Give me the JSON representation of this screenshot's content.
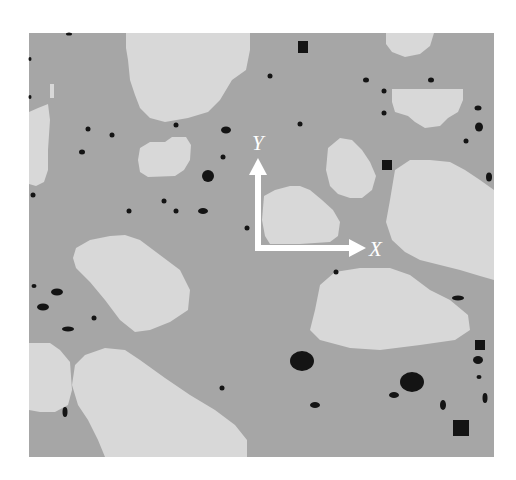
{
  "figure": {
    "frame": {
      "x": 29,
      "y": 33,
      "width": 465,
      "height": 424
    },
    "colors": {
      "background": "#ffffff",
      "matrix": "#a6a6a6",
      "grain": "#d8d8d8",
      "particle": "#141414",
      "axes": "#ffffff"
    },
    "axes": {
      "origin": {
        "x": 258,
        "y": 248
      },
      "x_label": "X",
      "y_label": "Y"
    },
    "grains": [
      {
        "id": "grain-top-center",
        "points": "126,33 250,33 250,50 246,70 232,80 220,100 208,112 188,118 165,122 150,118 140,108 135,95 130,80 128,60 126,48"
      },
      {
        "id": "grain-top-right",
        "points": "386,33 434,33 430,46 420,54 405,57 392,52 386,44"
      },
      {
        "id": "grain-right-upper",
        "points": "392,89 463,89 463,100 458,112 448,118 440,126 425,128 415,122 408,116 395,112 392,102"
      },
      {
        "id": "grain-left-edge",
        "points": "29,112 38,108 48,104 50,120 48,150 48,170 44,182 36,186 29,184"
      },
      {
        "id": "grain-small-center-left",
        "points": "140,148 150,142 165,142 172,137 186,137 191,145 190,160 184,170 175,176 148,177 140,172 138,160"
      },
      {
        "id": "grain-center",
        "points": "264,196 275,190 290,186 300,186 310,190 322,200 333,210 340,222 338,236 330,242 300,244 270,244 265,236 262,220"
      },
      {
        "id": "grain-center-right",
        "points": "328,148 340,138 352,140 362,150 370,162 376,176 372,190 362,198 350,198 338,194 330,186 326,170"
      },
      {
        "id": "grain-big-right",
        "points": "395,170 410,160 430,160 450,162 465,170 480,180 494,190 494,280 480,276 460,270 440,265 420,260 405,252 392,240 386,222 390,200"
      },
      {
        "id": "grain-left-center",
        "points": "76,248 90,240 110,236 125,235 140,240 160,255 180,270 190,290 188,310 170,322 150,330 135,332 120,320 105,300 90,282 76,268 73,258"
      },
      {
        "id": "grain-right-center-lower",
        "points": "320,285 335,272 360,268 390,268 410,275 430,290 450,300 468,315 470,330 455,340 420,345 380,350 350,348 320,340 310,330 315,310"
      },
      {
        "id": "grain-bottom-left-edge",
        "points": "29,343 50,343 60,350 70,362 72,390 68,405 55,412 40,412 29,410"
      },
      {
        "id": "grain-bottom-large",
        "points": "85,355 105,348 125,350 140,360 165,378 190,395 215,410 235,425 247,440 247,457 105,457 98,440 88,420 78,405 72,385 75,365"
      },
      {
        "id": "grain-small-mark",
        "points": "50,84 54,84 54,98 50,98"
      }
    ],
    "particles": [
      {
        "shape": "rect",
        "x": 298,
        "y": 41,
        "w": 10,
        "h": 12
      },
      {
        "shape": "rect",
        "x": 382,
        "y": 160,
        "w": 10,
        "h": 10
      },
      {
        "shape": "rect",
        "x": 453,
        "y": 420,
        "w": 16,
        "h": 16
      },
      {
        "shape": "rect",
        "x": 475,
        "y": 340,
        "w": 10,
        "h": 10
      },
      {
        "shape": "ellipse",
        "cx": 302,
        "cy": 361,
        "rx": 12,
        "ry": 10
      },
      {
        "shape": "ellipse",
        "cx": 412,
        "cy": 382,
        "rx": 12,
        "ry": 10
      },
      {
        "shape": "ellipse",
        "cx": 208,
        "cy": 176,
        "rx": 6,
        "ry": 6
      },
      {
        "shape": "ellipse",
        "cx": 226,
        "cy": 130,
        "rx": 5,
        "ry": 3.5
      },
      {
        "shape": "ellipse",
        "cx": 203,
        "cy": 211,
        "rx": 5,
        "ry": 3
      },
      {
        "shape": "ellipse",
        "cx": 57,
        "cy": 292,
        "rx": 6,
        "ry": 3.5
      },
      {
        "shape": "ellipse",
        "cx": 43,
        "cy": 307,
        "rx": 6,
        "ry": 3.5
      },
      {
        "shape": "ellipse",
        "cx": 68,
        "cy": 329,
        "rx": 6,
        "ry": 2.5
      },
      {
        "shape": "ellipse",
        "cx": 65,
        "cy": 412,
        "rx": 2.5,
        "ry": 5
      },
      {
        "shape": "ellipse",
        "cx": 394,
        "cy": 395,
        "rx": 5,
        "ry": 3
      },
      {
        "shape": "ellipse",
        "cx": 315,
        "cy": 405,
        "rx": 5,
        "ry": 3
      },
      {
        "shape": "ellipse",
        "cx": 443,
        "cy": 405,
        "rx": 3,
        "ry": 5
      },
      {
        "shape": "ellipse",
        "cx": 485,
        "cy": 398,
        "rx": 2.5,
        "ry": 5
      },
      {
        "shape": "ellipse",
        "cx": 478,
        "cy": 360,
        "rx": 5,
        "ry": 4
      },
      {
        "shape": "ellipse",
        "cx": 479,
        "cy": 377,
        "rx": 2.5,
        "ry": 2
      },
      {
        "shape": "ellipse",
        "cx": 458,
        "cy": 298,
        "rx": 6,
        "ry": 2.5
      },
      {
        "shape": "ellipse",
        "cx": 479,
        "cy": 127,
        "rx": 4,
        "ry": 4.5
      },
      {
        "shape": "ellipse",
        "cx": 489,
        "cy": 177,
        "rx": 3,
        "ry": 4.5
      },
      {
        "shape": "ellipse",
        "cx": 478,
        "cy": 108,
        "rx": 3.5,
        "ry": 2.5
      },
      {
        "shape": "ellipse",
        "cx": 466,
        "cy": 141,
        "rx": 2.5,
        "ry": 2.5
      },
      {
        "shape": "ellipse",
        "cx": 366,
        "cy": 80,
        "rx": 3,
        "ry": 2.5
      },
      {
        "shape": "ellipse",
        "cx": 431,
        "cy": 80,
        "rx": 3,
        "ry": 2.5
      },
      {
        "shape": "ellipse",
        "cx": 384,
        "cy": 91,
        "rx": 2.5,
        "ry": 2.5
      },
      {
        "shape": "ellipse",
        "cx": 384,
        "cy": 113,
        "rx": 2.5,
        "ry": 2.5
      },
      {
        "shape": "ellipse",
        "cx": 270,
        "cy": 76,
        "rx": 2.5,
        "ry": 2.5
      },
      {
        "shape": "ellipse",
        "cx": 300,
        "cy": 124,
        "rx": 2.5,
        "ry": 2.5
      },
      {
        "shape": "ellipse",
        "cx": 176,
        "cy": 125,
        "rx": 2.5,
        "ry": 2.5
      },
      {
        "shape": "ellipse",
        "cx": 88,
        "cy": 129,
        "rx": 2.5,
        "ry": 2.5
      },
      {
        "shape": "ellipse",
        "cx": 112,
        "cy": 135,
        "rx": 2.5,
        "ry": 2.5
      },
      {
        "shape": "ellipse",
        "cx": 82,
        "cy": 152,
        "rx": 3,
        "ry": 2.5
      },
      {
        "shape": "ellipse",
        "cx": 223,
        "cy": 157,
        "rx": 2.5,
        "ry": 2.5
      },
      {
        "shape": "ellipse",
        "cx": 33,
        "cy": 195,
        "rx": 2.5,
        "ry": 2.5
      },
      {
        "shape": "ellipse",
        "cx": 164,
        "cy": 201,
        "rx": 2.5,
        "ry": 2.5
      },
      {
        "shape": "ellipse",
        "cx": 129,
        "cy": 211,
        "rx": 2.5,
        "ry": 2.5
      },
      {
        "shape": "ellipse",
        "cx": 176,
        "cy": 211,
        "rx": 2.5,
        "ry": 2.5
      },
      {
        "shape": "ellipse",
        "cx": 247,
        "cy": 228,
        "rx": 2.5,
        "ry": 2.5
      },
      {
        "shape": "ellipse",
        "cx": 336,
        "cy": 272,
        "rx": 2.5,
        "ry": 2.5
      },
      {
        "shape": "ellipse",
        "cx": 34,
        "cy": 286,
        "rx": 2.5,
        "ry": 2
      },
      {
        "shape": "ellipse",
        "cx": 94,
        "cy": 318,
        "rx": 2.5,
        "ry": 2.5
      },
      {
        "shape": "ellipse",
        "cx": 222,
        "cy": 388,
        "rx": 2.5,
        "ry": 2.5
      },
      {
        "shape": "ellipse",
        "cx": 69,
        "cy": 34,
        "rx": 3,
        "ry": 1.5
      },
      {
        "shape": "ellipse",
        "cx": 30,
        "cy": 97,
        "rx": 1.5,
        "ry": 2
      },
      {
        "shape": "ellipse",
        "cx": 30,
        "cy": 59,
        "rx": 1.5,
        "ry": 2
      }
    ]
  }
}
